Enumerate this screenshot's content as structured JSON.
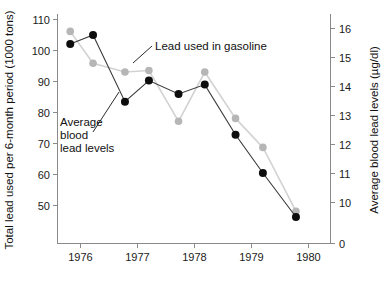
{
  "chart_data": {
    "type": "line",
    "title": "",
    "subtitle": "",
    "xlabel": "",
    "ylabel": "Total lead used per 6-month period (1000 tons)",
    "y2label": "Average blood lead levels (µg/dl)",
    "grid": false,
    "legend_position": "inline-annotations",
    "xlim": [
      1975.6,
      1980.1
    ],
    "x_ticks": [
      "1976",
      "1977",
      "1978",
      "1979",
      "1980"
    ],
    "x_tick_values": [
      1976,
      1977,
      1978,
      1979,
      1980
    ],
    "ylim": [
      44,
      112
    ],
    "y_ticks": [
      "50",
      "60",
      "70",
      "80",
      "90",
      "100",
      "110"
    ],
    "y_tick_values": [
      50,
      60,
      70,
      80,
      90,
      100,
      110
    ],
    "y2lim": [
      9.2,
      16.4
    ],
    "y2_ticks": [
      "0",
      "10",
      "11",
      "12",
      "13",
      "14",
      "15",
      "16"
    ],
    "y2_tick_values": [
      0,
      10,
      11,
      12,
      13,
      14,
      15,
      16
    ],
    "y2_axis_broken": true,
    "x": [
      1975.82,
      1976.22,
      1976.78,
      1977.2,
      1977.72,
      1978.18,
      1978.72,
      1979.2,
      1979.78
    ],
    "series": [
      {
        "name": "Lead used in gasoline",
        "axis": "left",
        "color": "#0d0d0d",
        "line_color": "#3a3a3a",
        "values": [
          102.1,
          105.0,
          83.5,
          90.3,
          86.0,
          89.0,
          72.8,
          60.5,
          46.3
        ],
        "units": "1000 tons"
      },
      {
        "name": "Average blood lead levels",
        "axis": "right",
        "color": "#b6b6b6",
        "line_color": "#d2d2d2",
        "values": [
          15.9,
          14.8,
          14.5,
          14.55,
          12.8,
          14.5,
          12.9,
          11.9,
          9.7
        ],
        "units": "µg/dl"
      }
    ],
    "annotations": [
      {
        "id": "gasoline-annotation",
        "text": "Lead used in gasoline",
        "lines": [
          "Lead used in gasoline"
        ]
      },
      {
        "id": "blood-annotation",
        "text": "Average blood lead levels",
        "lines": [
          "Average",
          "blood",
          "lead levels"
        ]
      }
    ]
  }
}
